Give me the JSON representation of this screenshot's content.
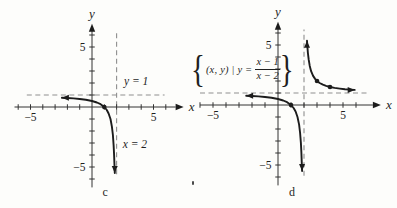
{
  "colors": {
    "curve": "#1c1c1c",
    "axis": "#333333",
    "dashed_asymptote": "#8f8f8f",
    "text": "#1f1f1f",
    "background": "#fdfdfb"
  },
  "chart_data": [
    {
      "type": "line",
      "id": "c",
      "caption": {
        "text": "c",
        "x": 0.85,
        "y": -7.4
      },
      "xlabel": "x",
      "ylabel": "y",
      "xlim": [
        -6.3,
        6.8
      ],
      "ylim": [
        -6.7,
        6.6
      ],
      "xticks": [
        -6,
        -5,
        -4,
        -3,
        -2,
        -1,
        1,
        2,
        3,
        4,
        5,
        6
      ],
      "yticks": [
        -6,
        -5,
        -4,
        -3,
        -2,
        -1,
        1,
        2,
        3,
        4,
        5,
        6
      ],
      "xtick_labels": [
        {
          "v": -5,
          "t": "−5"
        },
        {
          "v": 5,
          "t": "5"
        }
      ],
      "ytick_labels": [
        {
          "v": 5,
          "t": "5"
        },
        {
          "v": -5,
          "t": "−5"
        }
      ],
      "asymptotes": {
        "vertical": {
          "x": 2,
          "y_span": [
            -5.6,
            6.3
          ]
        },
        "horizontal": {
          "y": 1,
          "x_span": [
            -5.3,
            5.9
          ]
        }
      },
      "annotations": [
        {
          "text": "y = 1",
          "x": 2.6,
          "y": 1.85
        },
        {
          "text": "x = 2",
          "x": 2.5,
          "y": -3.4
        }
      ],
      "series": [
        {
          "name": "left-branch",
          "arrow_start": "left",
          "arrow_end": "down",
          "points": [
            [
              -2.45,
              0.775
            ],
            [
              -2,
              0.75
            ],
            [
              -1.5,
              0.714
            ],
            [
              -1,
              0.667
            ],
            [
              -0.5,
              0.6
            ],
            [
              0,
              0.5
            ],
            [
              0.4,
              0.375
            ],
            [
              0.7,
              0.231
            ],
            [
              1,
              0
            ],
            [
              1.2,
              -0.25
            ],
            [
              1.35,
              -0.538
            ],
            [
              1.5,
              -1
            ],
            [
              1.62,
              -1.632
            ],
            [
              1.7,
              -2.333
            ],
            [
              1.76,
              -3.167
            ],
            [
              1.8,
              -4
            ],
            [
              1.83,
              -4.882
            ],
            [
              1.85,
              -5.5
            ]
          ]
        }
      ],
      "marked_points": [
        [
          1,
          0
        ]
      ]
    },
    {
      "type": "line",
      "id": "d",
      "caption": {
        "text": "d",
        "x": 0.85,
        "y": -7.55
      },
      "function": "y = (x − 1)/(x − 2)",
      "set_label": {
        "open": "{",
        "prefix": "(x, y) | y =",
        "numerator": "x − 1",
        "denominator": "x − 2",
        "close": "}"
      },
      "xlabel": "x",
      "ylabel": "y",
      "xlim": [
        -6.0,
        7.3
      ],
      "ylim": [
        -6.7,
        6.6
      ],
      "xticks": [
        -6,
        -5,
        -4,
        -3,
        -2,
        -1,
        1,
        2,
        3,
        4,
        5,
        6
      ],
      "yticks": [
        -6,
        -5,
        -4,
        -3,
        -2,
        -1,
        1,
        2,
        3,
        4,
        5,
        6
      ],
      "xtick_labels": [
        {
          "v": -5,
          "t": "−5"
        },
        {
          "v": 5,
          "t": "5"
        }
      ],
      "ytick_labels": [
        {
          "v": 5,
          "t": "5"
        },
        {
          "v": -5,
          "t": "−5"
        }
      ],
      "asymptotes": {
        "vertical": {
          "x": 2,
          "y_span": [
            -5.9,
            6.3
          ]
        },
        "horizontal": {
          "y": 1,
          "x_span": [
            -6.0,
            7.0
          ]
        }
      },
      "annotations": [],
      "series": [
        {
          "name": "left-branch",
          "arrow_start": "left",
          "arrow_end": "down",
          "points": [
            [
              -2.45,
              0.775
            ],
            [
              -2,
              0.75
            ],
            [
              -1.5,
              0.714
            ],
            [
              -1,
              0.667
            ],
            [
              -0.5,
              0.6
            ],
            [
              0,
              0.5
            ],
            [
              0.4,
              0.375
            ],
            [
              0.7,
              0.231
            ],
            [
              1,
              0
            ],
            [
              1.2,
              -0.25
            ],
            [
              1.35,
              -0.538
            ],
            [
              1.5,
              -1
            ],
            [
              1.62,
              -1.632
            ],
            [
              1.7,
              -2.333
            ],
            [
              1.76,
              -3.167
            ],
            [
              1.8,
              -4
            ],
            [
              1.83,
              -4.882
            ],
            [
              1.85,
              -5.5
            ]
          ]
        },
        {
          "name": "right-branch",
          "arrow_start": "up",
          "arrow_end": "right",
          "points": [
            [
              2.23,
              5.35
            ],
            [
              2.26,
              4.846
            ],
            [
              2.3,
              4.333
            ],
            [
              2.36,
              3.778
            ],
            [
              2.44,
              3.273
            ],
            [
              2.55,
              2.818
            ],
            [
              2.7,
              2.429
            ],
            [
              2.85,
              2.176
            ],
            [
              3,
              2
            ],
            [
              3.2,
              1.833
            ],
            [
              3.45,
              1.69
            ],
            [
              3.7,
              1.588
            ],
            [
              4,
              1.5
            ],
            [
              4.35,
              1.426
            ],
            [
              4.75,
              1.364
            ],
            [
              5.15,
              1.317
            ],
            [
              5.55,
              1.282
            ],
            [
              5.9,
              1.256
            ]
          ]
        }
      ],
      "marked_points": [
        [
          1,
          0
        ],
        [
          3,
          2
        ],
        [
          4,
          1.5
        ]
      ]
    }
  ]
}
